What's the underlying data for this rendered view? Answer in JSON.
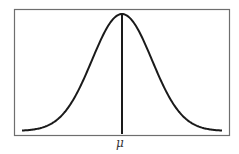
{
  "chart_data": {
    "type": "line",
    "title": "",
    "xlabel": "",
    "ylabel": "",
    "distribution": "normal",
    "mean_label": "μ",
    "x_ticks": [
      "μ"
    ],
    "grid": false,
    "legend": null,
    "series": [
      {
        "name": "density",
        "x_sigma": [
          -3.4,
          -3,
          -2.5,
          -2,
          -1.5,
          -1,
          -0.5,
          0,
          0.5,
          1,
          1.5,
          2,
          2.5,
          3,
          3.4
        ],
        "y_relative": [
          0.003,
          0.011,
          0.044,
          0.135,
          0.325,
          0.607,
          0.882,
          1.0,
          0.882,
          0.607,
          0.325,
          0.135,
          0.044,
          0.011,
          0.003
        ]
      }
    ],
    "annotations": [
      {
        "type": "vline",
        "x": 0,
        "label": "μ"
      }
    ],
    "colors": {
      "curve": "#1a1a1a",
      "frame": "#6e6e6e",
      "background": "#ffffff"
    }
  }
}
